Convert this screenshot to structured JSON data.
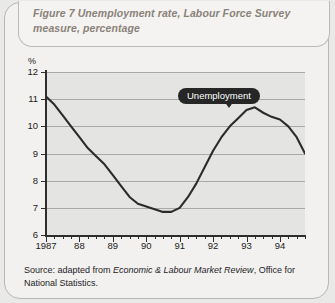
{
  "figure": {
    "title": "Figure 7  Unemployment rate, Labour Force Survey measure, percentage",
    "source_prefix": "Source: adapted from ",
    "source_italic": "Economic & Labour Market Review",
    "source_suffix": ", Office for National Statistics.",
    "callout_label": "Unemployment",
    "colors": {
      "line": "#2b2b2b",
      "plot_background": "#e4e4e2",
      "gridline": "#a9a9a6",
      "axis": "#2e2e2e",
      "title_text": "#8a8279",
      "callout_background": "#262626",
      "callout_text": "#ffffff",
      "page_background": "#f2f1ef"
    }
  },
  "chart_data": {
    "type": "line",
    "title": "Figure 7  Unemployment rate, Labour Force Survey measure, percentage",
    "xlabel": "",
    "ylabel": "%",
    "ylim": [
      6,
      12
    ],
    "xlim": [
      1987,
      1994.75
    ],
    "grid": true,
    "legend_position": "inline-callout",
    "y_ticks": [
      12,
      11,
      10,
      9,
      8,
      7,
      6
    ],
    "x_ticks": [
      "1987",
      "88",
      "89",
      "90",
      "91",
      "92",
      "93",
      "94"
    ],
    "x_tick_values": [
      1987,
      1988,
      1989,
      1990,
      1991,
      1992,
      1993,
      1994
    ],
    "minor_ticks_per_year": 4,
    "annotations": [
      {
        "text": "Unemployment",
        "x": 1992.5,
        "y": 10.8
      }
    ],
    "series": [
      {
        "name": "Unemployment",
        "x": [
          1987.0,
          1987.25,
          1987.5,
          1987.75,
          1988.0,
          1988.25,
          1988.5,
          1988.75,
          1989.0,
          1989.25,
          1989.5,
          1989.75,
          1990.0,
          1990.25,
          1990.5,
          1990.75,
          1991.0,
          1991.25,
          1991.5,
          1991.75,
          1992.0,
          1992.25,
          1992.5,
          1992.75,
          1993.0,
          1993.25,
          1993.5,
          1993.75,
          1994.0,
          1994.25,
          1994.5,
          1994.75
        ],
        "values": [
          11.1,
          10.8,
          10.4,
          10.0,
          9.6,
          9.2,
          8.9,
          8.6,
          8.2,
          7.8,
          7.4,
          7.15,
          7.05,
          6.95,
          6.85,
          6.85,
          7.0,
          7.4,
          7.9,
          8.5,
          9.1,
          9.6,
          10.0,
          10.3,
          10.6,
          10.7,
          10.5,
          10.35,
          10.25,
          10.0,
          9.6,
          9.0
        ]
      }
    ]
  }
}
